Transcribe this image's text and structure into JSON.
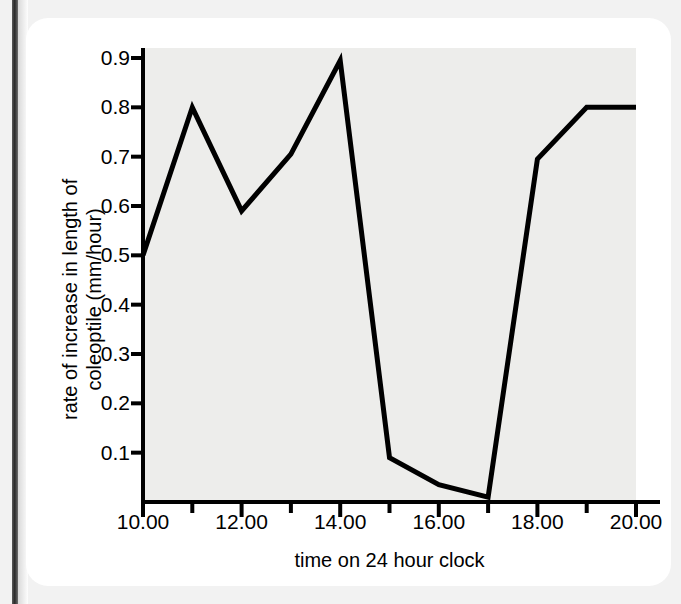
{
  "figure": {
    "background_color": "#ffffff",
    "panel_color": "#ededeb",
    "line_color": "#000000"
  },
  "chart_data": {
    "type": "line",
    "title": "",
    "xlabel": "time on 24 hour clock",
    "ylabel_line1": "rate of increase in length of",
    "ylabel_line2": "coleoptile (mm/hour)",
    "ylabel": "rate of increase in length of coleoptile (mm/hour)",
    "x": [
      10,
      11,
      12,
      13,
      14,
      15,
      16,
      17,
      18,
      19,
      20
    ],
    "values": [
      0.5,
      0.8,
      0.59,
      0.705,
      0.895,
      0.09,
      0.035,
      0.01,
      0.695,
      0.8,
      0.8
    ],
    "xtick_labels": [
      "10.00",
      "12.00",
      "14.00",
      "16.00",
      "18.00",
      "20.00"
    ],
    "xtick_values": [
      10,
      12,
      14,
      16,
      18,
      20
    ],
    "xminor_tick_values": [
      11,
      13,
      15,
      17,
      19
    ],
    "ytick_labels": [
      "0.9",
      "0.8",
      "0.7",
      "0.6",
      "0.5",
      "0.4",
      "0.3",
      "0.2",
      "0.1"
    ],
    "ytick_values": [
      0.9,
      0.8,
      0.7,
      0.6,
      0.5,
      0.4,
      0.3,
      0.2,
      0.1
    ],
    "xlim": [
      10,
      20
    ],
    "ylim": [
      0,
      0.96
    ],
    "grid": false,
    "legend": null
  }
}
